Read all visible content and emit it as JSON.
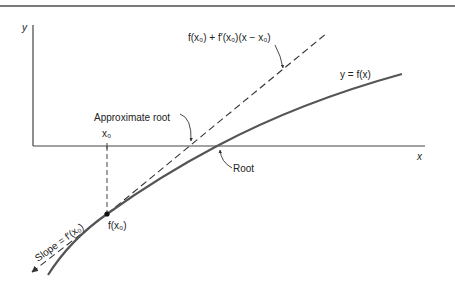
{
  "figure": {
    "type": "newton-method-geometric-illustration",
    "colors": {
      "ink": "#3a3a3a",
      "curve": "#555555",
      "rule": "#7a7a7a",
      "background": "#ffffff"
    }
  },
  "axes": {
    "y_label": "y",
    "x_label": "x"
  },
  "labels": {
    "tangent_line": "f(x₀) + f′(x₀)(x − x₀)",
    "curve": "y = f(x)",
    "approximate_root": "Approximate root",
    "root": "Root",
    "x0": "x₀",
    "point": "f(x₀)",
    "slope": "Slope = f′(x₀)"
  }
}
